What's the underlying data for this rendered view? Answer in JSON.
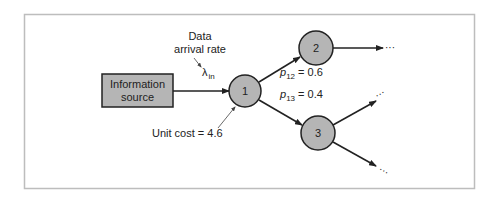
{
  "diagram": {
    "type": "network-flow",
    "source": {
      "label_line1": "Information",
      "label_line2": "source"
    },
    "arrival": {
      "label_line1": "Data",
      "label_line2": "arrival rate",
      "symbol": "λ",
      "subscript": "in"
    },
    "unit_cost": {
      "label": "Unit cost = 4.6"
    },
    "nodes": [
      {
        "id": "1",
        "label": "1"
      },
      {
        "id": "2",
        "label": "2"
      },
      {
        "id": "3",
        "label": "3"
      }
    ],
    "edges": [
      {
        "from": "source",
        "to": "1"
      },
      {
        "from": "1",
        "to": "2",
        "prob_symbol": "p",
        "prob_sub": "12",
        "prob_value": "= 0.6"
      },
      {
        "from": "1",
        "to": "3",
        "prob_symbol": "p",
        "prob_sub": "13",
        "prob_value": "= 0.4"
      },
      {
        "from": "2",
        "to": "…"
      },
      {
        "from": "3",
        "to": "…"
      },
      {
        "from": "3",
        "to": "…"
      }
    ],
    "continuation": "···",
    "colors": {
      "node_fill": "#b5b5b5",
      "stroke": "#222222",
      "frame": "#bdbdbd"
    }
  }
}
